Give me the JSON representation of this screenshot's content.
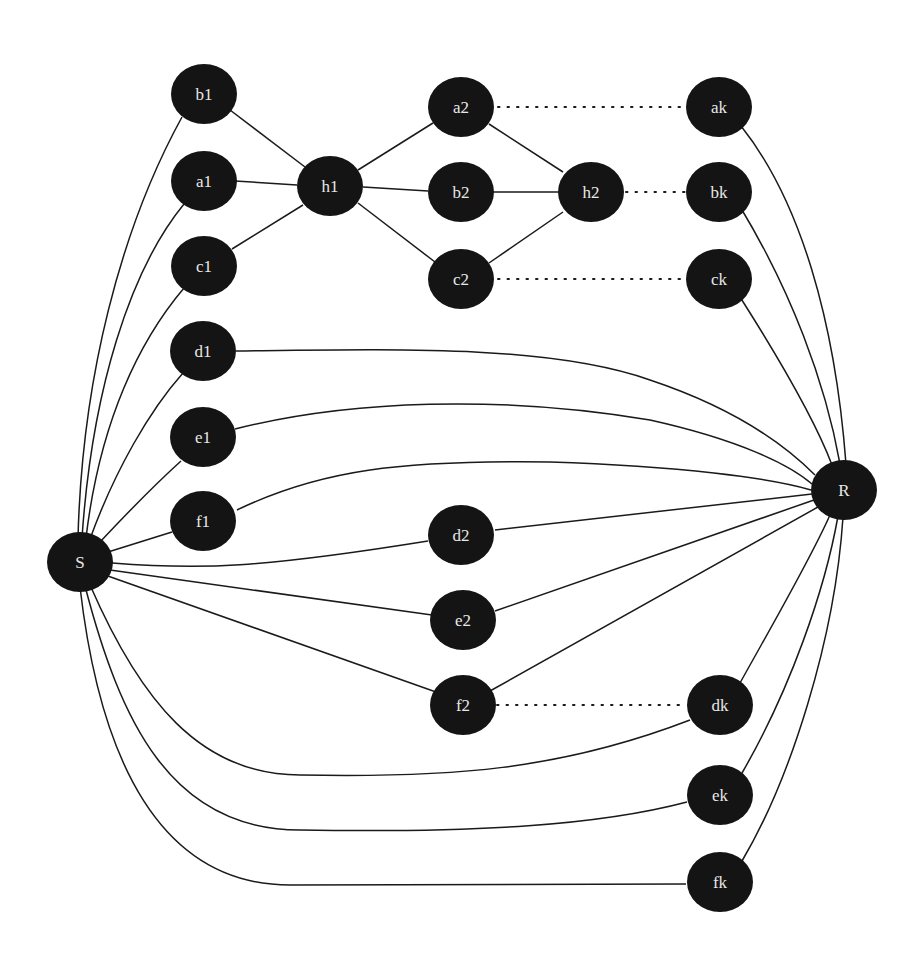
{
  "diagram": {
    "title": "",
    "nodes": [
      {
        "id": "b1",
        "label": "b1",
        "x": 204,
        "y": 94
      },
      {
        "id": "a1",
        "label": "a1",
        "x": 204,
        "y": 181
      },
      {
        "id": "c1",
        "label": "c1",
        "x": 204,
        "y": 266
      },
      {
        "id": "h1",
        "label": "h1",
        "x": 330,
        "y": 186
      },
      {
        "id": "a2",
        "label": "a2",
        "x": 461,
        "y": 107
      },
      {
        "id": "b2",
        "label": "b2",
        "x": 461,
        "y": 192
      },
      {
        "id": "c2",
        "label": "c2",
        "x": 461,
        "y": 279
      },
      {
        "id": "h2",
        "label": "h2",
        "x": 591,
        "y": 192
      },
      {
        "id": "ak",
        "label": "ak",
        "x": 719,
        "y": 107
      },
      {
        "id": "bk",
        "label": "bk",
        "x": 719,
        "y": 192
      },
      {
        "id": "ck",
        "label": "ck",
        "x": 719,
        "y": 279
      },
      {
        "id": "d1",
        "label": "d1",
        "x": 203,
        "y": 351
      },
      {
        "id": "e1",
        "label": "e1",
        "x": 203,
        "y": 437
      },
      {
        "id": "f1",
        "label": "f1",
        "x": 203,
        "y": 521
      },
      {
        "id": "S",
        "label": "S",
        "x": 80,
        "y": 562
      },
      {
        "id": "R",
        "label": "R",
        "x": 844,
        "y": 490
      },
      {
        "id": "d2",
        "label": "d2",
        "x": 461,
        "y": 535
      },
      {
        "id": "e2",
        "label": "e2",
        "x": 463,
        "y": 620
      },
      {
        "id": "f2",
        "label": "f2",
        "x": 463,
        "y": 705
      },
      {
        "id": "dk",
        "label": "dk",
        "x": 720,
        "y": 705
      },
      {
        "id": "ek",
        "label": "ek",
        "x": 720,
        "y": 795
      },
      {
        "id": "fk",
        "label": "fk",
        "x": 720,
        "y": 882
      }
    ],
    "edges": [
      {
        "from": "b1",
        "to": "h1",
        "style": "solid"
      },
      {
        "from": "a1",
        "to": "h1",
        "style": "solid"
      },
      {
        "from": "c1",
        "to": "h1",
        "style": "solid"
      },
      {
        "from": "h1",
        "to": "a2",
        "style": "solid"
      },
      {
        "from": "h1",
        "to": "b2",
        "style": "solid"
      },
      {
        "from": "h1",
        "to": "c2",
        "style": "solid"
      },
      {
        "from": "a2",
        "to": "h2",
        "style": "solid"
      },
      {
        "from": "b2",
        "to": "h2",
        "style": "solid"
      },
      {
        "from": "c2",
        "to": "h2",
        "style": "solid"
      },
      {
        "from": "a2",
        "to": "ak",
        "style": "dotted"
      },
      {
        "from": "h2",
        "to": "bk",
        "style": "dotted"
      },
      {
        "from": "c2",
        "to": "ck",
        "style": "dotted"
      },
      {
        "from": "f2",
        "to": "dk",
        "style": "dotted"
      },
      {
        "from": "S",
        "to": "b1",
        "style": "solid"
      },
      {
        "from": "S",
        "to": "a1",
        "style": "solid"
      },
      {
        "from": "S",
        "to": "c1",
        "style": "solid"
      },
      {
        "from": "S",
        "to": "d1",
        "style": "solid"
      },
      {
        "from": "S",
        "to": "e1",
        "style": "solid"
      },
      {
        "from": "S",
        "to": "f1",
        "style": "solid"
      },
      {
        "from": "S",
        "to": "d2",
        "style": "solid"
      },
      {
        "from": "S",
        "to": "e2",
        "style": "solid"
      },
      {
        "from": "S",
        "to": "f2",
        "style": "solid"
      },
      {
        "from": "S",
        "to": "dk",
        "style": "solid"
      },
      {
        "from": "S",
        "to": "ek",
        "style": "solid"
      },
      {
        "from": "S",
        "to": "fk",
        "style": "solid"
      },
      {
        "from": "d1",
        "to": "R",
        "style": "solid"
      },
      {
        "from": "e1",
        "to": "R",
        "style": "solid"
      },
      {
        "from": "f1",
        "to": "R",
        "style": "solid"
      },
      {
        "from": "d2",
        "to": "R",
        "style": "solid"
      },
      {
        "from": "e2",
        "to": "R",
        "style": "solid"
      },
      {
        "from": "f2",
        "to": "R",
        "style": "solid"
      },
      {
        "from": "ak",
        "to": "R",
        "style": "solid"
      },
      {
        "from": "bk",
        "to": "R",
        "style": "solid"
      },
      {
        "from": "ck",
        "to": "R",
        "style": "solid"
      },
      {
        "from": "dk",
        "to": "R",
        "style": "solid"
      },
      {
        "from": "ek",
        "to": "R",
        "style": "solid"
      },
      {
        "from": "fk",
        "to": "R",
        "style": "solid"
      }
    ],
    "colors": {
      "node_fill": "#141414",
      "node_text": "#e8e8e8",
      "edge": "#1a1a1a",
      "background": "#ffffff"
    }
  }
}
